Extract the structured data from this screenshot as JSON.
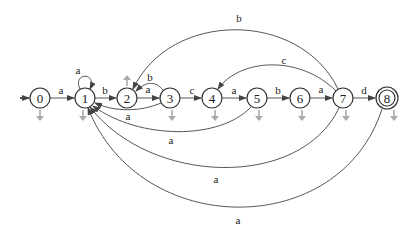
{
  "diagram": {
    "type": "finite-state-automaton",
    "start_state": "0",
    "accept_states": [
      "8"
    ],
    "states": [
      {
        "id": "0",
        "label": "0",
        "x": 40,
        "y": 98
      },
      {
        "id": "1",
        "label": "1",
        "x": 85,
        "y": 98
      },
      {
        "id": "2",
        "label": "2",
        "x": 127,
        "y": 98
      },
      {
        "id": "3",
        "label": "3",
        "x": 170,
        "y": 98
      },
      {
        "id": "4",
        "label": "4",
        "x": 212,
        "y": 98
      },
      {
        "id": "5",
        "label": "5",
        "x": 257,
        "y": 98
      },
      {
        "id": "6",
        "label": "6",
        "x": 300,
        "y": 98
      },
      {
        "id": "7",
        "label": "7",
        "x": 343,
        "y": 98
      },
      {
        "id": "8",
        "label": "8",
        "x": 387,
        "y": 98
      }
    ],
    "transitions": [
      {
        "from": "0",
        "to": "1",
        "label": "a"
      },
      {
        "from": "1",
        "to": "1",
        "label": "a"
      },
      {
        "from": "1",
        "to": "2",
        "label": "b"
      },
      {
        "from": "2",
        "to": "3",
        "label": "a"
      },
      {
        "from": "3",
        "to": "2",
        "label": "b"
      },
      {
        "from": "3",
        "to": "1",
        "label": "a"
      },
      {
        "from": "3",
        "to": "4",
        "label": "c"
      },
      {
        "from": "4",
        "to": "5",
        "label": "a"
      },
      {
        "from": "5",
        "to": "1",
        "label": "a"
      },
      {
        "from": "5",
        "to": "6",
        "label": "b"
      },
      {
        "from": "6",
        "to": "7",
        "label": "a"
      },
      {
        "from": "7",
        "to": "2",
        "label": "b"
      },
      {
        "from": "7",
        "to": "4",
        "label": "c"
      },
      {
        "from": "7",
        "to": "8",
        "label": "d"
      },
      {
        "from": "7",
        "to": "1",
        "label": "a"
      },
      {
        "from": "8",
        "to": "1",
        "label": "a"
      }
    ],
    "labels": {
      "e01": "a",
      "e11": "a",
      "e12": "b",
      "e23": "a",
      "e32": "b",
      "e31": "a",
      "e34": "c",
      "e45": "a",
      "e51": "a",
      "e56": "b",
      "e67": "a",
      "e72": "b",
      "e74": "c",
      "e78": "d",
      "e71": "a",
      "e81": "a"
    },
    "colors": {
      "node_stroke": "#333333",
      "edge": "#444444",
      "fail_arrow": "#aaaaaa",
      "background": "#ffffff"
    }
  }
}
